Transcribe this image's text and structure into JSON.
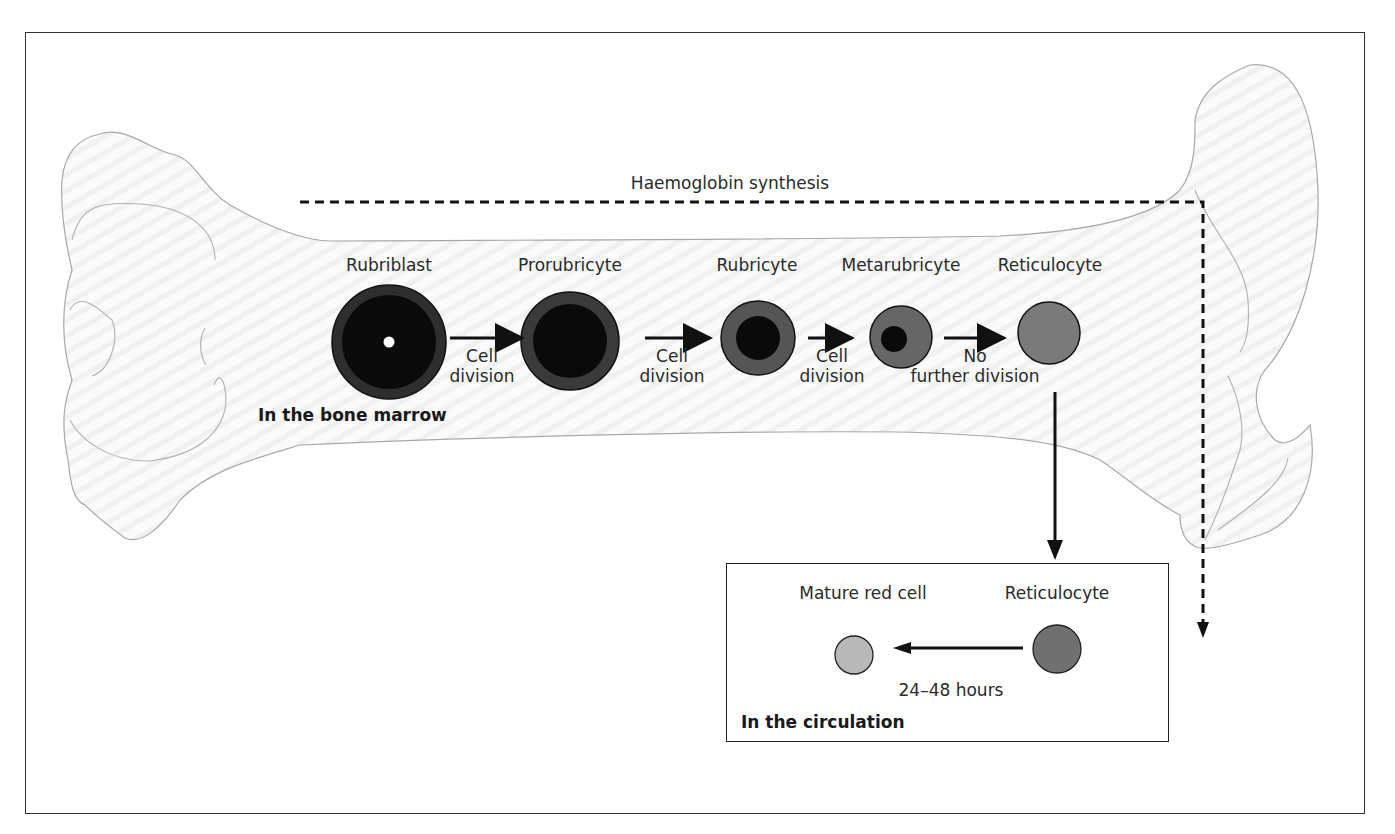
{
  "diagram": {
    "title_line": "Haemoglobin synthesis",
    "stages": [
      {
        "name": "Rubriblast"
      },
      {
        "name": "Prorubricyte"
      },
      {
        "name": "Rubricyte"
      },
      {
        "name": "Metarubricyte"
      },
      {
        "name": "Reticulocyte"
      }
    ],
    "transitions": [
      {
        "line1": "Cell",
        "line2": "division"
      },
      {
        "line1": "Cell",
        "line2": "division"
      },
      {
        "line1": "Cell",
        "line2": "division"
      },
      {
        "line1": "No",
        "line2": "further division"
      }
    ],
    "marrow_label": "In the bone marrow",
    "circulation": {
      "mature_label": "Mature red cell",
      "reticulocyte_label": "Reticulocyte",
      "duration": "24–48 hours",
      "location_label": "In the circulation"
    },
    "colors": {
      "nucleus": "#0a0a0a",
      "cytoplasm_dark": "#2e2e2e",
      "cytoplasm_mid": "#555555",
      "reticulocyte": "#777777",
      "mature_cell": "#b5b5b5",
      "bone_outline": "#a8a8a8"
    }
  }
}
